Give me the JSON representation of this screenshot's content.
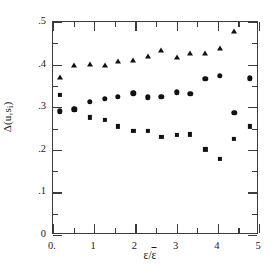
{
  "figure": {
    "ylabel": "Δ(u,s",
    "ylabel_sub": "i",
    "ylabel_close": ")",
    "xlabel_num": "ε",
    "xlabel_slash": "/",
    "xlabel_den": "ε",
    "background": "#ffffff",
    "ink": "#111111"
  },
  "chart_data": {
    "type": "scatter",
    "title": "",
    "xlabel": "ε/ε̄",
    "ylabel": "Δ(u,sᵢ)",
    "xlim": [
      0,
      5
    ],
    "ylim": [
      0,
      0.5
    ],
    "xticks": [
      0,
      1,
      2,
      3,
      4,
      5
    ],
    "xticklabels": [
      "0.",
      "1",
      "2",
      "3",
      "4",
      "5"
    ],
    "xminorticks": [
      0.5,
      1.5,
      2.5,
      3.5,
      4.5
    ],
    "yticks": [
      0,
      0.1,
      0.2,
      0.3,
      0.4,
      0.5
    ],
    "yticklabels": [
      "0",
      ".1",
      ".2",
      ".3",
      ".4",
      ".5"
    ],
    "yminorticks": [
      0.05,
      0.15,
      0.25,
      0.35,
      0.45
    ],
    "grid": false,
    "legend": null,
    "series": [
      {
        "name": "upper-branch",
        "marker": "triangle",
        "color": "#111111",
        "points": [
          [
            0.17,
            0.372
          ],
          [
            0.52,
            0.398
          ],
          [
            0.9,
            0.401
          ],
          [
            1.25,
            0.4
          ],
          [
            1.58,
            0.409
          ],
          [
            1.95,
            0.411
          ],
          [
            2.3,
            0.421
          ],
          [
            2.63,
            0.435
          ],
          [
            3.0,
            0.418
          ],
          [
            3.33,
            0.427
          ],
          [
            3.7,
            0.428
          ],
          [
            4.05,
            0.438
          ],
          [
            4.4,
            0.479
          ]
        ]
      },
      {
        "name": "middle-branch",
        "marker": "circle",
        "color": "#111111",
        "points": [
          [
            0.17,
            0.29
          ],
          [
            0.52,
            0.295
          ],
          [
            0.9,
            0.312
          ],
          [
            1.25,
            0.32
          ],
          [
            1.58,
            0.325
          ],
          [
            1.95,
            0.333
          ],
          [
            2.3,
            0.323
          ],
          [
            2.63,
            0.325
          ],
          [
            3.0,
            0.335
          ],
          [
            3.33,
            0.331
          ],
          [
            3.7,
            0.367
          ],
          [
            4.05,
            0.374
          ],
          [
            4.4,
            0.287
          ],
          [
            4.77,
            0.368
          ]
        ]
      },
      {
        "name": "lower-branch",
        "marker": "square",
        "color": "#111111",
        "points": [
          [
            0.17,
            0.328
          ],
          [
            0.52,
            0.294
          ],
          [
            0.9,
            0.276
          ],
          [
            1.25,
            0.27
          ],
          [
            1.58,
            0.255
          ],
          [
            1.95,
            0.245
          ],
          [
            2.3,
            0.245
          ],
          [
            2.63,
            0.23
          ],
          [
            3.0,
            0.235
          ],
          [
            3.33,
            0.236
          ],
          [
            3.7,
            0.201
          ],
          [
            4.05,
            0.179
          ],
          [
            4.4,
            0.225
          ],
          [
            4.77,
            0.255
          ]
        ]
      }
    ]
  }
}
